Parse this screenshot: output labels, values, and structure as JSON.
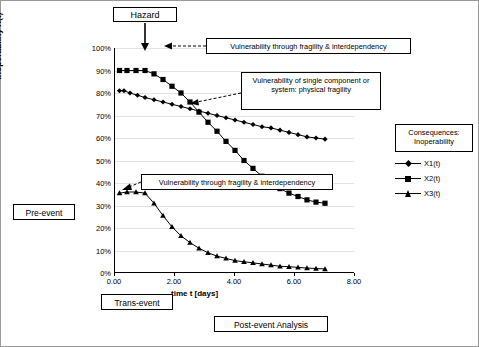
{
  "chart_data": {
    "type": "line",
    "title": "",
    "xlabel": "time t [days]",
    "ylabel": "Inoperability X(t)",
    "xlim": [
      0,
      8
    ],
    "ylim": [
      0,
      1
    ],
    "grid": true,
    "legend_position": "right",
    "x_ticks": [
      "0.00",
      "2.00",
      "4.00",
      "6.00",
      "8.00"
    ],
    "y_ticks": [
      "0%",
      "10%",
      "20%",
      "30%",
      "40%",
      "50%",
      "60%",
      "70%",
      "80%",
      "90%",
      "100%"
    ],
    "series": [
      {
        "name": "X1(t)",
        "marker": "diamond",
        "x": [
          0.15,
          0.3,
          0.5,
          0.75,
          1.0,
          1.3,
          1.6,
          1.9,
          2.2,
          2.5,
          2.8,
          3.1,
          3.4,
          3.7,
          4.0,
          4.3,
          4.6,
          4.9,
          5.2,
          5.5,
          5.8,
          6.1,
          6.4,
          6.7,
          7.0
        ],
        "values": [
          0.81,
          0.81,
          0.8,
          0.79,
          0.78,
          0.77,
          0.76,
          0.75,
          0.74,
          0.73,
          0.72,
          0.71,
          0.7,
          0.69,
          0.68,
          0.67,
          0.66,
          0.65,
          0.645,
          0.635,
          0.625,
          0.615,
          0.605,
          0.6,
          0.595
        ]
      },
      {
        "name": "X2(t)",
        "marker": "square",
        "x": [
          0.15,
          0.4,
          0.7,
          1.0,
          1.3,
          1.6,
          1.9,
          2.2,
          2.5,
          2.8,
          3.1,
          3.4,
          3.7,
          4.0,
          4.3,
          4.6,
          4.9,
          5.2,
          5.5,
          5.8,
          6.1,
          6.4,
          6.7,
          7.0
        ],
        "values": [
          0.9,
          0.9,
          0.9,
          0.9,
          0.885,
          0.86,
          0.83,
          0.8,
          0.76,
          0.715,
          0.67,
          0.63,
          0.585,
          0.545,
          0.5,
          0.465,
          0.43,
          0.4,
          0.375,
          0.355,
          0.34,
          0.325,
          0.315,
          0.31
        ]
      },
      {
        "name": "X3(t)",
        "marker": "triangle",
        "x": [
          0.15,
          0.4,
          0.7,
          1.0,
          1.3,
          1.6,
          1.9,
          2.2,
          2.5,
          2.8,
          3.1,
          3.4,
          3.7,
          4.0,
          4.3,
          4.6,
          4.9,
          5.2,
          5.5,
          5.8,
          6.1,
          6.4,
          6.7,
          7.0
        ],
        "values": [
          0.355,
          0.36,
          0.36,
          0.355,
          0.31,
          0.255,
          0.205,
          0.165,
          0.135,
          0.11,
          0.09,
          0.075,
          0.065,
          0.055,
          0.05,
          0.045,
          0.04,
          0.035,
          0.03,
          0.028,
          0.025,
          0.022,
          0.02,
          0.018
        ]
      }
    ]
  },
  "annotations": {
    "hazard": "Hazard",
    "vulnerability_top": "Vulnerability through fragility & interdependency",
    "vulnerability_single": "Vulnerability of single component or system: physical fragility",
    "vulnerability_mid": "Vulnerability through fragility & interdependency",
    "consequences": "Consequences: Inoperability",
    "pre_event": "Pre-event",
    "trans_event": "Trans-event",
    "post_event": "Post-event Analysis"
  },
  "legend": {
    "items": [
      {
        "label": "X1(t)",
        "marker": "diamond"
      },
      {
        "label": "X2(t)",
        "marker": "square"
      },
      {
        "label": "X3(t)",
        "marker": "triangle"
      }
    ]
  },
  "colors": {
    "line": "#000000",
    "grid": "#e2e2e2",
    "background": "#ffffff",
    "border": "#9a9a9a"
  }
}
